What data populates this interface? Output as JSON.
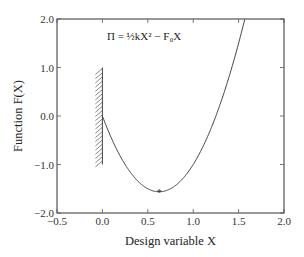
{
  "chart_data": {
    "type": "line",
    "title": "",
    "xlabel": "Design variable X",
    "ylabel": "Function F(X)",
    "xlim": [
      -0.5,
      2.0
    ],
    "ylim": [
      -2.0,
      2.0
    ],
    "x_ticks": [
      -0.5,
      0.0,
      0.5,
      1.0,
      1.5,
      2.0
    ],
    "x_tick_labels": [
      "−0.5",
      "0.0",
      "0.5",
      "1.0",
      "1.5",
      "2.0"
    ],
    "y_ticks": [
      -2.0,
      -1.0,
      0.0,
      1.0,
      2.0
    ],
    "y_tick_labels": [
      "−2.0",
      "−1.0",
      "0.0",
      "1.0",
      "2.0"
    ],
    "grid": false,
    "legend": null,
    "annotation": {
      "text": "Π = ½kX² − F₀X",
      "x": 0.05,
      "y": 1.6
    },
    "series": [
      {
        "name": "potential energy",
        "equation": "F(X) = 4 X^2 - 5 X",
        "x": [
          0.0,
          0.1,
          0.2,
          0.3,
          0.4,
          0.5,
          0.625,
          0.7,
          0.8,
          0.9,
          1.0,
          1.1,
          1.2,
          1.25,
          1.3,
          1.4,
          1.5,
          1.58
        ],
        "values": [
          0.0,
          -0.46,
          -0.84,
          -1.14,
          -1.36,
          -1.5,
          -1.5625,
          -1.54,
          -1.44,
          -1.26,
          -1.0,
          -0.66,
          -0.24,
          0.0,
          0.26,
          0.84,
          1.5,
          2.0
        ]
      }
    ],
    "markers": [
      {
        "name": "minimum",
        "x": 0.625,
        "y": -1.5625,
        "symbol": "*"
      }
    ],
    "wall": {
      "x": 0.0,
      "y_from": -1.0,
      "y_to": 1.0,
      "style": "hatched"
    }
  }
}
